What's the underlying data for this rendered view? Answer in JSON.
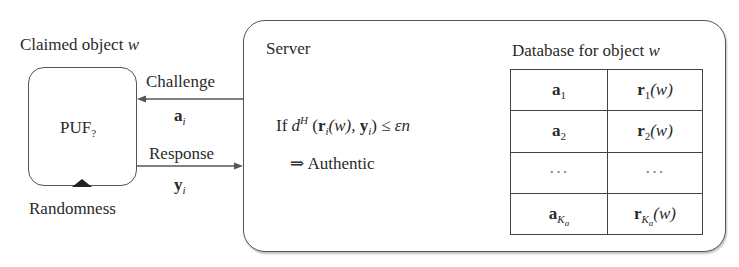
{
  "diagram": {
    "claimed_object_label": "Claimed object",
    "claimed_object_var": "w",
    "puf_label": "PUF",
    "puf_subscript": "?",
    "randomness_label": "Randomness",
    "challenge": {
      "label": "Challenge",
      "symbol": "a",
      "symbol_sub": "i",
      "direction": "server-to-puf"
    },
    "response": {
      "label": "Response",
      "symbol": "y",
      "symbol_sub": "i",
      "direction": "puf-to-server"
    },
    "server": {
      "label": "Server",
      "condition": {
        "if": "If",
        "d": "d",
        "d_sup": "H",
        "open": "(",
        "r": "r",
        "r_sub": "i",
        "r_arg": "(w),",
        "y": "y",
        "y_sub": "i",
        "close": ")",
        "leq": "≤",
        "rhs": "εn"
      },
      "implies": "⇒",
      "result": "Authentic"
    },
    "database": {
      "title": "Database for object",
      "title_var": "w",
      "rows": [
        {
          "challenge": "a",
          "challenge_sub": "1",
          "response": "r",
          "response_sub": "1",
          "response_arg": "(w)"
        },
        {
          "challenge": "a",
          "challenge_sub": "2",
          "response": "r",
          "response_sub": "2",
          "response_arg": "(w)"
        },
        {
          "challenge": "···",
          "challenge_sub": "",
          "response": "···",
          "response_sub": "",
          "response_arg": ""
        },
        {
          "challenge": "a",
          "challenge_sub": "K",
          "challenge_subsub": "a",
          "response": "r",
          "response_sub": "K",
          "response_subsub": "a",
          "response_arg": "(w)"
        }
      ]
    }
  }
}
